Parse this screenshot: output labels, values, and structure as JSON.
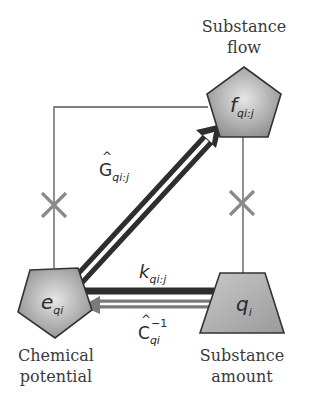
{
  "nodes": {
    "substance_flow": {
      "caption_line1": "Substance",
      "caption_line2": "flow",
      "symbol": "f",
      "subscript": "qi:j",
      "shape": "pentagon"
    },
    "chemical_potential": {
      "caption_line1": "Chemical",
      "caption_line2": "potential",
      "symbol": "e",
      "subscript": "qi",
      "shape": "inverted-pentagon"
    },
    "substance_amount": {
      "caption_line1": "Substance",
      "caption_line2": "amount",
      "symbol": "q",
      "subscript": "i",
      "shape": "trapezoid"
    }
  },
  "edges": {
    "gyrator": {
      "symbol": "G",
      "hat": "^",
      "subscript": "qi:j",
      "from": "chemical_potential",
      "to": "substance_flow",
      "style": "hollow-double-arrow"
    },
    "rate_constant": {
      "symbol": "k",
      "subscript": "qi:j",
      "from": "substance_amount",
      "to": "chemical_potential",
      "style": "thick-dark-line"
    },
    "capacitance_inverse": {
      "symbol": "C",
      "hat": "^",
      "subscript": "qi",
      "superscript": "−1",
      "from": "substance_amount",
      "to": "chemical_potential",
      "style": "hollow-gray-arrow"
    },
    "blocked_left": {
      "marker": "×"
    },
    "blocked_right": {
      "marker": "×"
    }
  },
  "colors": {
    "node_fill_light": "#e2e2e2",
    "node_fill_dark": "#8e8e8e",
    "node_stroke": "#333333",
    "arrow_dark": "#2e2e2e",
    "arrow_gray": "#7a7a7a",
    "connector": "#555555",
    "cross": "#8a8a8a"
  }
}
